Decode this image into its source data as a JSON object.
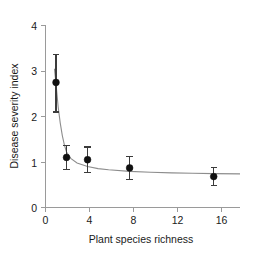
{
  "chart_data": {
    "type": "scatter",
    "title": "",
    "xlabel": "Plant species richness",
    "ylabel": "Disease severity index",
    "xlim": [
      0,
      18.5
    ],
    "ylim": [
      0,
      4
    ],
    "xticks": [
      0,
      4,
      8,
      12,
      16
    ],
    "xtick_labels": [
      "0",
      "4",
      "8",
      "12",
      "16"
    ],
    "yticks": [
      0,
      1,
      2,
      3,
      4
    ],
    "ytick_labels": [
      "0",
      "1",
      "2",
      "3",
      "4"
    ],
    "grid": false,
    "legend": null,
    "x": [
      1,
      2,
      4,
      8,
      16
    ],
    "values": [
      2.75,
      1.1,
      1.05,
      0.87,
      0.68
    ],
    "yerr_upper": [
      0.62,
      0.27,
      0.28,
      0.25,
      0.2
    ],
    "yerr_lower": [
      0.65,
      0.27,
      0.28,
      0.25,
      0.2
    ],
    "series": [
      {
        "name": "Disease severity index",
        "marker": "filled-circle",
        "marker_color": "#111111",
        "errorbar_color": "#3b3b3b",
        "values": [
          2.75,
          1.1,
          1.05,
          0.87,
          0.68
        ]
      },
      {
        "name": "fitted decay curve",
        "type": "line",
        "line_color": "#8d8d8d",
        "equation_note": "decaying curve approaching asymptote near 0.72"
      }
    ],
    "fit_curve_points": [
      [
        0.85,
        3.05
      ],
      [
        1.0,
        2.72
      ],
      [
        1.2,
        2.22
      ],
      [
        1.4,
        1.86
      ],
      [
        1.6,
        1.58
      ],
      [
        1.8,
        1.37
      ],
      [
        2.0,
        1.22
      ],
      [
        2.4,
        1.08
      ],
      [
        3.0,
        0.98
      ],
      [
        4.0,
        0.9
      ],
      [
        5.0,
        0.855
      ],
      [
        6.0,
        0.83
      ],
      [
        8.0,
        0.795
      ],
      [
        10.0,
        0.775
      ],
      [
        12.0,
        0.762
      ],
      [
        14.0,
        0.752
      ],
      [
        16.0,
        0.745
      ],
      [
        18.5,
        0.74
      ]
    ]
  },
  "axes": {
    "x_title": "Plant species richness",
    "y_title": "Disease severity index"
  }
}
